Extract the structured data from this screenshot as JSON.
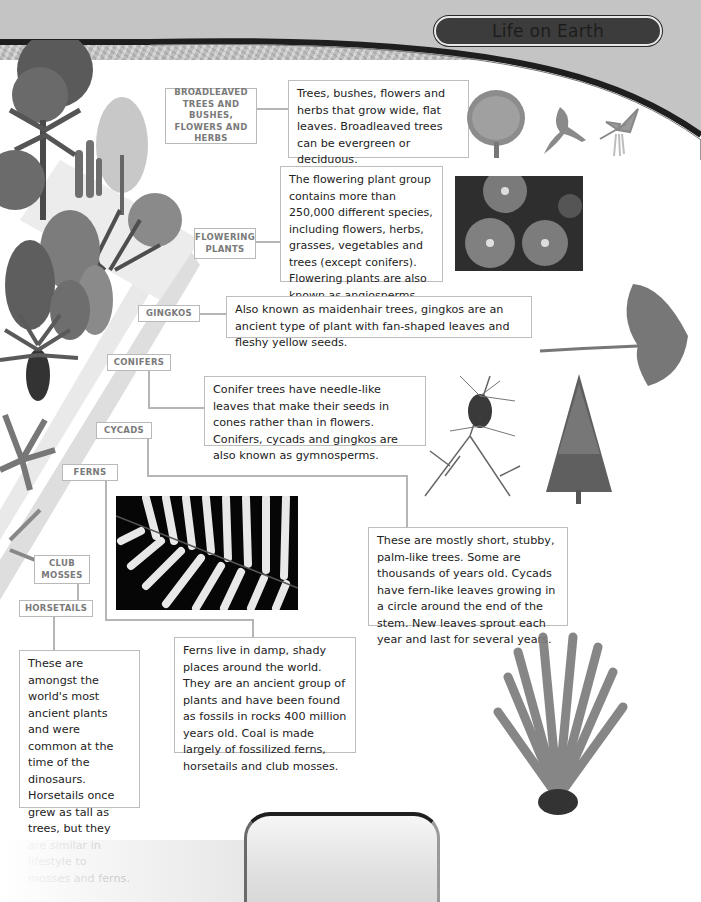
{
  "header": {
    "title": "Life on Earth"
  },
  "labels": {
    "broadleaved": "BROADLEAVED TREES AND BUSHES, FLOWERS AND HERBS",
    "flowering": "FLOWERING PLANTS",
    "gingkos": "GINGKOS",
    "conifers": "CONIFERS",
    "cycads": "CYCADS",
    "ferns": "FERNS",
    "club_mosses": "CLUB MOSSES",
    "horsetails": "HORSETAILS"
  },
  "descriptions": {
    "broadleaved": "Trees, bushes, flowers and herbs that grow wide, flat leaves. Broadleaved trees can be evergreen or deciduous.",
    "flowering": "The flowering plant group contains more than 250,000 different species, including flowers, herbs, grasses, vegetables and trees (except conifers). Flowering plants are also known as angiosperms.",
    "gingkos": "Also known as maidenhair trees, gingkos are an ancient type of plant with fan-shaped leaves and fleshy yellow seeds.",
    "conifers": "Conifer trees have needle-like leaves that make their seeds in cones rather than in flowers. Conifers, cycads and gingkos are also known as gymnosperms.",
    "cycads": "These are mostly short, stubby, palm-like trees. Some are thousands of years old. Cycads have fern-like leaves growing in a circle around the end of the stem. New leaves sprout each year and last for several years.",
    "ferns": "Ferns live in damp, shady places around the world. They are an ancient group of plants and have been found as fossils in rocks 400 million years old. Coal is made largely of fossilized ferns, horsetails and club mosses.",
    "horsetails": "These are amongst the world's most ancient plants and were common at the time of the dinosaurs. Horsetails once grew as tall as trees, but they are similar in lifestyle to mosses and ferns."
  },
  "illustrations": {
    "broadleaf_tree": "broadleaf-tree-illustration",
    "oak_leaf": "oak-leaf-illustration",
    "catkin_leaf": "catkin-leaf-illustration",
    "flower_photo": "gerbera-flowers-photo",
    "ginkgo_leaf": "ginkgo-leaf-illustration",
    "larch_branch": "larch-branch-illustration",
    "fir_tree": "fir-tree-illustration",
    "fern_photo": "fern-frond-photo",
    "cycad_plant": "cycad-plant-illustration",
    "plant_diagonal": "plant-evolution-diagonal-illustration"
  },
  "colors": {
    "label_border": "#b9b9b9",
    "label_text": "#7a7a7a",
    "body_text": "#222222",
    "title_pill": "#3c3c3c"
  }
}
